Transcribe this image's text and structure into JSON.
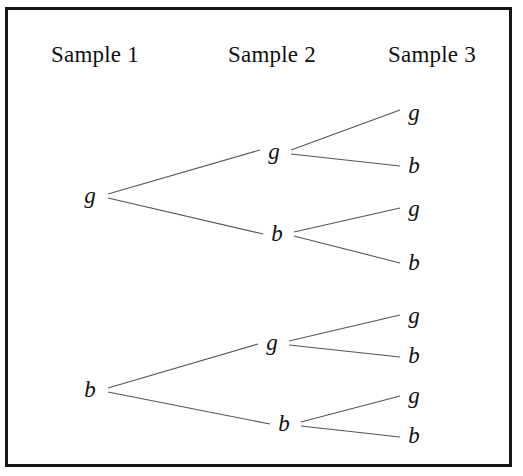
{
  "figure": {
    "width": 523,
    "height": 476,
    "background": "#ffffff",
    "border_color": "#151515",
    "line_color": "#555555",
    "text_color": "#101010"
  },
  "headers": [
    {
      "label": "Sample 1",
      "x": 95,
      "y": 55
    },
    {
      "label": "Sample 2",
      "x": 272,
      "y": 55
    },
    {
      "label": "Sample 3",
      "x": 432,
      "y": 55
    }
  ],
  "nodes": [
    {
      "id": "n1",
      "label": "g",
      "level": 1,
      "x": 90,
      "y": 196
    },
    {
      "id": "n2",
      "label": "b",
      "level": 1,
      "x": 90,
      "y": 390
    },
    {
      "id": "n1g",
      "label": "g",
      "level": 2,
      "x": 274,
      "y": 152
    },
    {
      "id": "n1b",
      "label": "b",
      "level": 2,
      "x": 277,
      "y": 234
    },
    {
      "id": "n2g",
      "label": "g",
      "level": 2,
      "x": 272,
      "y": 343
    },
    {
      "id": "n2b",
      "label": "b",
      "level": 2,
      "x": 284,
      "y": 424
    },
    {
      "id": "l1",
      "label": "g",
      "level": 3,
      "x": 414,
      "y": 113
    },
    {
      "id": "l2",
      "label": "b",
      "level": 3,
      "x": 414,
      "y": 166
    },
    {
      "id": "l3",
      "label": "g",
      "level": 3,
      "x": 414,
      "y": 209
    },
    {
      "id": "l4",
      "label": "b",
      "level": 3,
      "x": 414,
      "y": 263
    },
    {
      "id": "l5",
      "label": "g",
      "level": 3,
      "x": 414,
      "y": 316
    },
    {
      "id": "l6",
      "label": "b",
      "level": 3,
      "x": 414,
      "y": 356
    },
    {
      "id": "l7",
      "label": "g",
      "level": 3,
      "x": 414,
      "y": 396
    },
    {
      "id": "l8",
      "label": "b",
      "level": 3,
      "x": 414,
      "y": 436
    }
  ],
  "edges": [
    {
      "from": "n1",
      "to": "n1g",
      "x1": 108,
      "y1": 194,
      "x2": 260,
      "y2": 150
    },
    {
      "from": "n1",
      "to": "n1b",
      "x1": 108,
      "y1": 198,
      "x2": 263,
      "y2": 234
    },
    {
      "from": "n2",
      "to": "n2g",
      "x1": 108,
      "y1": 388,
      "x2": 258,
      "y2": 344
    },
    {
      "from": "n2",
      "to": "n2b",
      "x1": 108,
      "y1": 392,
      "x2": 270,
      "y2": 424
    },
    {
      "from": "n1g",
      "to": "l1",
      "x1": 291,
      "y1": 150,
      "x2": 400,
      "y2": 110
    },
    {
      "from": "n1g",
      "to": "l2",
      "x1": 291,
      "y1": 154,
      "x2": 400,
      "y2": 166
    },
    {
      "from": "n1b",
      "to": "l3",
      "x1": 294,
      "y1": 232,
      "x2": 400,
      "y2": 208
    },
    {
      "from": "n1b",
      "to": "l4",
      "x1": 294,
      "y1": 236,
      "x2": 400,
      "y2": 263
    },
    {
      "from": "n2g",
      "to": "l5",
      "x1": 289,
      "y1": 341,
      "x2": 400,
      "y2": 315
    },
    {
      "from": "n2g",
      "to": "l6",
      "x1": 289,
      "y1": 345,
      "x2": 400,
      "y2": 357
    },
    {
      "from": "n2b",
      "to": "l7",
      "x1": 301,
      "y1": 422,
      "x2": 400,
      "y2": 396
    },
    {
      "from": "n2b",
      "to": "l8",
      "x1": 301,
      "y1": 426,
      "x2": 400,
      "y2": 437
    }
  ],
  "legend": {
    "g_meaning": "g",
    "b_meaning": "b"
  }
}
